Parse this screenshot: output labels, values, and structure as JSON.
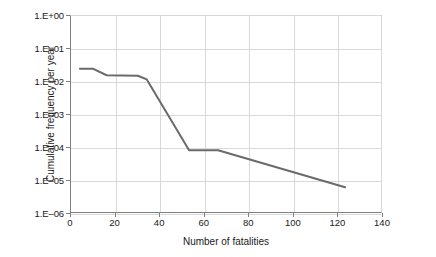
{
  "chart_data": {
    "type": "line",
    "title": "",
    "subtitle": "",
    "xlabel": "Number of fatalities",
    "ylabel": "Cumulative frequency per year",
    "xlim": [
      0,
      140
    ],
    "ylim": [
      1e-06,
      1
    ],
    "yscale": "log",
    "xscale": "linear",
    "grid": true,
    "legend": false,
    "legend_position": "none",
    "x_ticks": [
      0,
      20,
      40,
      60,
      80,
      100,
      120,
      140
    ],
    "x_tick_labels": [
      "0",
      "20",
      "40",
      "60",
      "80",
      "100",
      "120",
      "140"
    ],
    "y_ticks": [
      1,
      0.1,
      0.01,
      0.001,
      0.0001,
      1e-05,
      1e-06
    ],
    "y_tick_labels": [
      "1.E+00",
      "1.E–01",
      "1.E–02",
      "1.E–03",
      "1.E–04",
      "1.E–05",
      "1.E–06"
    ],
    "series": [
      {
        "name": "Cumulative frequency",
        "color": "#6a6a6a",
        "line_width": 2,
        "marker": "none",
        "x": [
          4,
          10,
          16,
          30,
          34,
          53,
          66,
          123
        ],
        "y": [
          0.025,
          0.025,
          0.016,
          0.0155,
          0.012,
          8.5e-05,
          8.5e-05,
          6.5e-06
        ]
      }
    ],
    "annotations": []
  },
  "axes": {
    "y_title": "Cumulative frequency per year",
    "x_title": "Number of fatalities"
  },
  "style": {
    "line_color": "#6a6a6a",
    "grid_color": "#d9d9d9",
    "axis_color": "#808080",
    "text_color": "#1a1a1a",
    "background": "#ffffff"
  }
}
